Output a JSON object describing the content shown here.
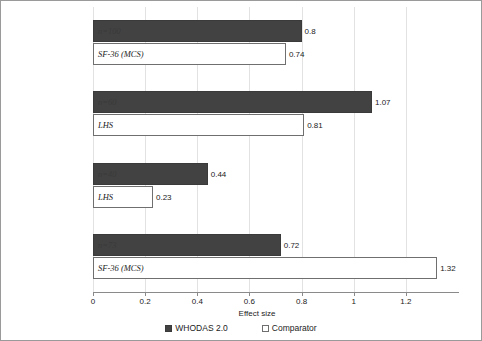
{
  "chart_data": {
    "type": "bar",
    "orientation": "horizontal",
    "title": "",
    "xlabel": "Effect size",
    "ylabel": "",
    "xlim": [
      0,
      1.4
    ],
    "xticks": [
      "0",
      "0.2",
      "0.4",
      "0.6",
      "0.8",
      "1",
      "1.2"
    ],
    "xtick_values": [
      0,
      0.2,
      0.4,
      0.6,
      0.8,
      1.0,
      1.2
    ],
    "grid": true,
    "legend_position": "bottom",
    "categories": [
      "Outpatient care\n(Mexico City)",
      "Outpatient care\n(Ibadan, Nigeria)",
      "Outpatient care of elderly\n(London, England)",
      "Primary health care\n(Seattle, USA)"
    ],
    "series": [
      {
        "name": "WHODAS 2.0",
        "values": [
          0.8,
          1.07,
          0.44,
          0.72
        ],
        "color": "#424242"
      },
      {
        "name": "Comparator",
        "values": [
          0.74,
          0.81,
          0.23,
          1.32
        ],
        "color": "#ffffff"
      }
    ],
    "bar_annotations": [
      {
        "whodas": "n=100",
        "comparator": "SF-36 (MCS)"
      },
      {
        "whodas": "n=60",
        "comparator": "LHS"
      },
      {
        "whodas": "n=40",
        "comparator": "LHS"
      },
      {
        "whodas": "n=73",
        "comparator": "SF-36 (MCS)"
      }
    ],
    "value_labels": {
      "whodas": [
        "0.8",
        "1.07",
        "0.44",
        "0.72"
      ],
      "comparator": [
        "0.74",
        "0.81",
        "0.23",
        "1.32"
      ]
    }
  },
  "groups": [
    {
      "label_line1": "Outpatient care",
      "label_line2": "(Mexico City)",
      "whodas": {
        "value": 0.8,
        "value_label": "0.8",
        "annotation": "n=100"
      },
      "comparator": {
        "value": 0.74,
        "value_label": "0.74",
        "annotation": "SF-36 (MCS)"
      }
    },
    {
      "label_line1": "Outpatient care",
      "label_line2": "(Ibadan, Nigeria)",
      "whodas": {
        "value": 1.07,
        "value_label": "1.07",
        "annotation": "n=60"
      },
      "comparator": {
        "value": 0.81,
        "value_label": "0.81",
        "annotation": "LHS"
      }
    },
    {
      "label_line1": "Outpatient care of elderly",
      "label_line2": "(London, England)",
      "whodas": {
        "value": 0.44,
        "value_label": "0.44",
        "annotation": "n=40"
      },
      "comparator": {
        "value": 0.23,
        "value_label": "0.23",
        "annotation": "LHS"
      }
    },
    {
      "label_line1": "Primary health care",
      "label_line2": "(Seattle, USA)",
      "whodas": {
        "value": 0.72,
        "value_label": "0.72",
        "annotation": "n=73"
      },
      "comparator": {
        "value": 1.32,
        "value_label": "1.32",
        "annotation": "SF-36 (MCS)"
      }
    }
  ],
  "axis": {
    "xlabel": "Effect size",
    "ticks": [
      "0",
      "0.2",
      "0.4",
      "0.6",
      "0.8",
      "1",
      "1.2"
    ]
  },
  "legend": {
    "items": [
      {
        "label": "WHODAS 2.0",
        "swatch": "dark"
      },
      {
        "label": "Comparator",
        "swatch": "light"
      }
    ]
  }
}
